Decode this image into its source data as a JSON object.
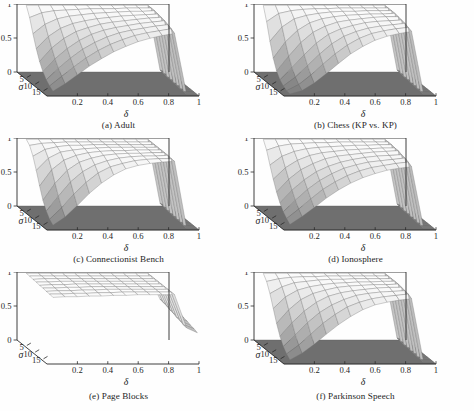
{
  "figure": {
    "type": "multi-panel-3d-surface-grid",
    "rows": 3,
    "cols": 2,
    "background": "#ffffff",
    "ink": "#262626"
  },
  "axes_common": {
    "xlabel": "δ",
    "ylabel": "σ",
    "zlabel": "γ",
    "xticks": [
      "0.2",
      "0.4",
      "0.6",
      "0.8",
      "1"
    ],
    "xtick_values": [
      0.2,
      0.4,
      0.6,
      0.8,
      1
    ],
    "yticks": [
      "5",
      "10",
      "15"
    ],
    "ytick_values": [
      5,
      10,
      15
    ],
    "zticks": [
      "1",
      "0.5",
      "0"
    ],
    "ztick_values": [
      1,
      0.5,
      0
    ],
    "xlim": [
      0,
      1
    ],
    "ylim": [
      0,
      18
    ],
    "zlim": [
      0,
      1
    ]
  },
  "chart_data": [
    {
      "type": "surface",
      "panel": "a",
      "title": "(a) Adult",
      "xlabel": "δ",
      "ylabel": "σ",
      "zlabel": "γ",
      "xlim": [
        0,
        1
      ],
      "ylim": [
        0,
        18
      ],
      "zlim": [
        0,
        1
      ],
      "grid": true,
      "x": [
        0.05,
        0.13,
        0.21,
        0.29,
        0.37,
        0.45,
        0.53,
        0.61,
        0.69,
        0.77,
        0.85,
        0.93,
        1.0
      ],
      "y": [
        1,
        3,
        5,
        7,
        9,
        11,
        13,
        15,
        17
      ],
      "z": [
        [
          1.0,
          1.0,
          1.0,
          1.0,
          1.0,
          1.0,
          1.0,
          1.0,
          1.0,
          1.0,
          1.0,
          0.05,
          0.0
        ],
        [
          0.86,
          0.93,
          0.96,
          0.97,
          0.98,
          0.99,
          0.99,
          0.99,
          1.0,
          1.0,
          1.0,
          0.04,
          0.0
        ],
        [
          0.66,
          0.8,
          0.88,
          0.92,
          0.94,
          0.96,
          0.97,
          0.98,
          0.99,
          0.99,
          1.0,
          0.03,
          0.0
        ],
        [
          0.48,
          0.66,
          0.78,
          0.85,
          0.89,
          0.92,
          0.94,
          0.96,
          0.97,
          0.98,
          0.99,
          0.03,
          0.0
        ],
        [
          0.33,
          0.53,
          0.67,
          0.77,
          0.83,
          0.88,
          0.91,
          0.93,
          0.95,
          0.97,
          0.98,
          0.02,
          0.0
        ],
        [
          0.22,
          0.41,
          0.56,
          0.68,
          0.77,
          0.83,
          0.87,
          0.9,
          0.93,
          0.95,
          0.97,
          0.02,
          0.0
        ],
        [
          0.14,
          0.31,
          0.46,
          0.59,
          0.69,
          0.77,
          0.83,
          0.87,
          0.9,
          0.93,
          0.95,
          0.01,
          0.0
        ],
        [
          0.09,
          0.23,
          0.37,
          0.5,
          0.61,
          0.7,
          0.77,
          0.83,
          0.87,
          0.9,
          0.93,
          0.01,
          0.0
        ],
        [
          0.05,
          0.16,
          0.29,
          0.42,
          0.53,
          0.63,
          0.71,
          0.78,
          0.83,
          0.87,
          0.9,
          0.0,
          0.0
        ]
      ],
      "notes": "Smooth monotone rise with δ; decays with σ; sharp cliff to 0 at δ≈0.85; dark floor plane beyond."
    },
    {
      "type": "surface",
      "panel": "b",
      "title": "(b) Chess (KP vs. KP)",
      "xlabel": "δ",
      "ylabel": "σ",
      "zlabel": "γ",
      "xlim": [
        0,
        1
      ],
      "ylim": [
        0,
        18
      ],
      "zlim": [
        0,
        1
      ],
      "grid": true,
      "x": [
        0.05,
        0.13,
        0.21,
        0.29,
        0.37,
        0.45,
        0.53,
        0.61,
        0.69,
        0.77,
        0.85,
        0.93,
        1.0
      ],
      "y": [
        1,
        3,
        5,
        7,
        9,
        11,
        13,
        15,
        17
      ],
      "z": [
        [
          1.0,
          1.0,
          1.0,
          1.0,
          1.0,
          1.0,
          1.0,
          1.0,
          1.0,
          1.0,
          1.0,
          0.05,
          0.0
        ],
        [
          0.8,
          0.92,
          0.96,
          0.98,
          0.99,
          0.99,
          1.0,
          1.0,
          1.0,
          1.0,
          1.0,
          0.04,
          0.0
        ],
        [
          0.55,
          0.76,
          0.88,
          0.93,
          0.96,
          0.98,
          0.99,
          0.99,
          1.0,
          1.0,
          1.0,
          0.03,
          0.0
        ],
        [
          0.34,
          0.58,
          0.75,
          0.86,
          0.92,
          0.95,
          0.97,
          0.98,
          0.99,
          0.99,
          1.0,
          0.03,
          0.0
        ],
        [
          0.19,
          0.41,
          0.61,
          0.76,
          0.85,
          0.91,
          0.94,
          0.96,
          0.98,
          0.99,
          0.99,
          0.02,
          0.0
        ],
        [
          0.1,
          0.28,
          0.47,
          0.64,
          0.77,
          0.85,
          0.9,
          0.94,
          0.96,
          0.97,
          0.98,
          0.02,
          0.0
        ],
        [
          0.05,
          0.18,
          0.35,
          0.52,
          0.67,
          0.78,
          0.85,
          0.9,
          0.93,
          0.95,
          0.97,
          0.01,
          0.0
        ],
        [
          0.02,
          0.11,
          0.25,
          0.41,
          0.56,
          0.69,
          0.79,
          0.86,
          0.9,
          0.93,
          0.95,
          0.01,
          0.0
        ],
        [
          0.01,
          0.06,
          0.17,
          0.31,
          0.46,
          0.6,
          0.71,
          0.8,
          0.86,
          0.9,
          0.93,
          0.0,
          0.0
        ]
      ],
      "notes": "Steeper σ decay than (a); strong terraced mesh; cliff at δ≈0.85."
    },
    {
      "type": "surface",
      "panel": "c",
      "title": "(c) Connectionist Bench",
      "xlabel": "δ",
      "ylabel": "σ",
      "zlabel": "γ",
      "xlim": [
        0,
        1
      ],
      "ylim": [
        0,
        18
      ],
      "zlim": [
        0,
        1
      ],
      "grid": true,
      "x": [
        0.05,
        0.13,
        0.21,
        0.29,
        0.37,
        0.45,
        0.53,
        0.61,
        0.69,
        0.77,
        0.85,
        0.93,
        1.0
      ],
      "y": [
        1,
        3,
        5,
        7,
        9,
        11,
        13,
        15,
        17
      ],
      "z": [
        [
          1.0,
          1.0,
          1.0,
          1.0,
          1.0,
          1.0,
          1.0,
          1.0,
          1.0,
          1.0,
          1.0,
          0.06,
          0.0
        ],
        [
          0.95,
          0.98,
          0.99,
          1.0,
          1.0,
          1.0,
          1.0,
          1.0,
          1.0,
          1.0,
          1.0,
          0.05,
          0.0
        ],
        [
          0.83,
          0.93,
          0.97,
          0.99,
          0.99,
          1.0,
          1.0,
          1.0,
          1.0,
          1.0,
          1.0,
          0.04,
          0.0
        ],
        [
          0.66,
          0.84,
          0.93,
          0.96,
          0.98,
          0.99,
          1.0,
          1.0,
          1.0,
          1.0,
          1.0,
          0.03,
          0.0
        ],
        [
          0.47,
          0.71,
          0.85,
          0.92,
          0.96,
          0.98,
          0.99,
          0.99,
          1.0,
          1.0,
          1.0,
          0.03,
          0.0
        ],
        [
          0.3,
          0.55,
          0.74,
          0.86,
          0.92,
          0.96,
          0.98,
          0.99,
          0.99,
          1.0,
          1.0,
          0.02,
          0.0
        ],
        [
          0.18,
          0.4,
          0.61,
          0.76,
          0.86,
          0.92,
          0.96,
          0.98,
          0.99,
          0.99,
          1.0,
          0.02,
          0.0
        ],
        [
          0.1,
          0.27,
          0.47,
          0.64,
          0.78,
          0.87,
          0.92,
          0.96,
          0.98,
          0.99,
          0.99,
          0.01,
          0.0
        ],
        [
          0.05,
          0.17,
          0.34,
          0.52,
          0.67,
          0.79,
          0.88,
          0.93,
          0.96,
          0.98,
          0.99,
          0.0,
          0.0
        ]
      ],
      "notes": "Broad flat high plateau; slow decay; long smooth ramp; cliff at δ≈0.85."
    },
    {
      "type": "surface",
      "panel": "d",
      "title": "(d) Ionosphere",
      "xlabel": "δ",
      "ylabel": "σ",
      "zlabel": "γ",
      "xlim": [
        0,
        1
      ],
      "ylim": [
        0,
        18
      ],
      "zlim": [
        0,
        1
      ],
      "grid": true,
      "x": [
        0.05,
        0.13,
        0.21,
        0.29,
        0.37,
        0.45,
        0.53,
        0.61,
        0.69,
        0.77,
        0.85,
        0.93,
        1.0
      ],
      "y": [
        1,
        3,
        5,
        7,
        9,
        11,
        13,
        15,
        17
      ],
      "z": [
        [
          1.0,
          1.0,
          1.0,
          1.0,
          1.0,
          1.0,
          1.0,
          1.0,
          1.0,
          1.0,
          1.0,
          0.05,
          0.0
        ],
        [
          0.88,
          0.94,
          0.97,
          0.98,
          0.99,
          0.99,
          1.0,
          1.0,
          1.0,
          1.0,
          1.0,
          0.04,
          0.0
        ],
        [
          0.7,
          0.83,
          0.9,
          0.94,
          0.96,
          0.97,
          0.98,
          0.99,
          0.99,
          1.0,
          1.0,
          0.03,
          0.0
        ],
        [
          0.53,
          0.7,
          0.81,
          0.88,
          0.92,
          0.94,
          0.96,
          0.97,
          0.98,
          0.99,
          0.99,
          0.03,
          0.0
        ],
        [
          0.38,
          0.57,
          0.71,
          0.8,
          0.87,
          0.91,
          0.93,
          0.95,
          0.97,
          0.98,
          0.99,
          0.02,
          0.0
        ],
        [
          0.26,
          0.45,
          0.6,
          0.72,
          0.8,
          0.86,
          0.9,
          0.93,
          0.95,
          0.96,
          0.97,
          0.02,
          0.0
        ],
        [
          0.17,
          0.34,
          0.5,
          0.63,
          0.73,
          0.81,
          0.86,
          0.9,
          0.92,
          0.94,
          0.96,
          0.01,
          0.0
        ],
        [
          0.11,
          0.25,
          0.4,
          0.54,
          0.65,
          0.74,
          0.81,
          0.86,
          0.89,
          0.92,
          0.94,
          0.01,
          0.0
        ],
        [
          0.06,
          0.18,
          0.31,
          0.45,
          0.57,
          0.67,
          0.75,
          0.81,
          0.86,
          0.89,
          0.91,
          0.0,
          0.0
        ]
      ],
      "notes": "Very similar to (a); dense mesh lines; cliff at δ≈0.85."
    },
    {
      "type": "surface",
      "panel": "e",
      "title": "(e) Page Blocks",
      "xlabel": "δ",
      "ylabel": "σ",
      "zlabel": "γ",
      "xlim": [
        0,
        1
      ],
      "ylim": [
        0,
        18
      ],
      "zlim": [
        0,
        1
      ],
      "grid": true,
      "x": [
        0.05,
        0.13,
        0.21,
        0.29,
        0.37,
        0.45,
        0.53,
        0.61,
        0.69,
        0.77,
        0.85,
        0.93,
        1.0
      ],
      "y": [
        1,
        3,
        5,
        7,
        9,
        11,
        13,
        15,
        17
      ],
      "z": [
        [
          1.0,
          1.0,
          1.0,
          1.0,
          1.0,
          1.0,
          1.0,
          1.0,
          1.0,
          1.0,
          1.0,
          0.62,
          0.55
        ],
        [
          1.0,
          1.0,
          1.0,
          1.0,
          1.0,
          1.0,
          1.0,
          1.0,
          1.0,
          1.0,
          1.0,
          0.61,
          0.54
        ],
        [
          0.99,
          1.0,
          1.0,
          1.0,
          1.0,
          1.0,
          1.0,
          1.0,
          1.0,
          1.0,
          1.0,
          0.6,
          0.53
        ],
        [
          0.99,
          0.99,
          1.0,
          1.0,
          1.0,
          1.0,
          1.0,
          1.0,
          1.0,
          1.0,
          1.0,
          0.58,
          0.52
        ],
        [
          0.98,
          0.99,
          0.99,
          1.0,
          1.0,
          1.0,
          1.0,
          1.0,
          1.0,
          1.0,
          1.0,
          0.57,
          0.5
        ],
        [
          0.98,
          0.98,
          0.99,
          0.99,
          1.0,
          1.0,
          1.0,
          1.0,
          1.0,
          1.0,
          1.0,
          0.55,
          0.49
        ],
        [
          0.97,
          0.98,
          0.98,
          0.99,
          0.99,
          1.0,
          1.0,
          1.0,
          1.0,
          1.0,
          1.0,
          0.54,
          0.47
        ],
        [
          0.97,
          0.97,
          0.98,
          0.98,
          0.99,
          0.99,
          1.0,
          1.0,
          1.0,
          1.0,
          1.0,
          0.52,
          0.46
        ],
        [
          0.96,
          0.97,
          0.97,
          0.98,
          0.98,
          0.99,
          0.99,
          1.0,
          1.0,
          1.0,
          1.0,
          0.51,
          0.44
        ]
      ],
      "notes": "Essentially flat plateau at γ≈1 across all δ and σ; abrupt vertical drop at δ≈0.85 to a partially-hanging sheet; no dark floor visible."
    },
    {
      "type": "surface",
      "panel": "f",
      "title": "(f) Parkinson Speech",
      "xlabel": "δ",
      "ylabel": "σ",
      "zlabel": "γ",
      "xlim": [
        0,
        1
      ],
      "ylim": [
        0,
        18
      ],
      "zlim": [
        0,
        1
      ],
      "grid": true,
      "x": [
        0.05,
        0.13,
        0.21,
        0.29,
        0.37,
        0.45,
        0.53,
        0.61,
        0.69,
        0.77,
        0.85,
        0.93,
        1.0
      ],
      "y": [
        1,
        3,
        5,
        7,
        9,
        11,
        13,
        15,
        17
      ],
      "z": [
        [
          1.0,
          1.0,
          1.0,
          1.0,
          1.0,
          1.0,
          1.0,
          1.0,
          1.0,
          1.0,
          1.0,
          0.05,
          0.0
        ],
        [
          0.92,
          0.96,
          0.98,
          0.99,
          0.99,
          1.0,
          1.0,
          1.0,
          1.0,
          1.0,
          1.0,
          0.04,
          0.0
        ],
        [
          0.78,
          0.88,
          0.94,
          0.96,
          0.98,
          0.99,
          0.99,
          1.0,
          1.0,
          1.0,
          1.0,
          0.03,
          0.0
        ],
        [
          0.6,
          0.77,
          0.87,
          0.92,
          0.95,
          0.97,
          0.98,
          0.99,
          0.99,
          1.0,
          1.0,
          0.03,
          0.0
        ],
        [
          0.42,
          0.62,
          0.77,
          0.86,
          0.91,
          0.95,
          0.97,
          0.98,
          0.99,
          0.99,
          1.0,
          0.02,
          0.0
        ],
        [
          0.27,
          0.47,
          0.64,
          0.77,
          0.86,
          0.91,
          0.94,
          0.96,
          0.98,
          0.99,
          0.99,
          0.02,
          0.0
        ],
        [
          0.16,
          0.33,
          0.51,
          0.66,
          0.77,
          0.85,
          0.91,
          0.94,
          0.96,
          0.97,
          0.98,
          0.01,
          0.0
        ],
        [
          0.09,
          0.22,
          0.38,
          0.54,
          0.67,
          0.78,
          0.85,
          0.9,
          0.93,
          0.95,
          0.97,
          0.01,
          0.0
        ],
        [
          0.04,
          0.14,
          0.27,
          0.42,
          0.56,
          0.68,
          0.78,
          0.85,
          0.89,
          0.92,
          0.94,
          0.0,
          0.0
        ]
      ],
      "notes": "Wide light ramp; lower-σ rows rise quickly; cliff at δ≈0.85; dark floor band."
    }
  ]
}
